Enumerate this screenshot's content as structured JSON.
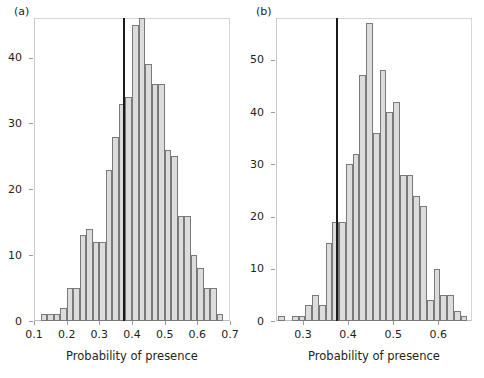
{
  "figure": {
    "width": 484,
    "height": 378,
    "background": "#ffffff",
    "bar_fill": "#dcdcdc",
    "bar_stroke": "#7a7a7a",
    "vline_color": "#1a1a1a",
    "frame_color": "#d6d6d6"
  },
  "chart_data": [
    {
      "type": "bar",
      "panel": "(a)",
      "title": "",
      "subtitle": "",
      "xlabel": "Probability of presence",
      "ylabel": "",
      "xlim": [
        0.1,
        0.7
      ],
      "ylim": [
        0,
        46
      ],
      "grid": false,
      "legend": "none",
      "xticks": [
        0.1,
        0.2,
        0.3,
        0.4,
        0.5,
        0.6,
        0.7
      ],
      "xtick_labels": [
        "0.1",
        "0.2",
        "0.3",
        "0.4",
        "0.5",
        "0.6",
        "0.7"
      ],
      "yticks": [
        0,
        10,
        20,
        30,
        40
      ],
      "ytick_labels": [
        "0",
        "10",
        "20",
        "30",
        "40"
      ],
      "bin_width": 0.02,
      "bin_starts": [
        0.12,
        0.14,
        0.16,
        0.18,
        0.2,
        0.22,
        0.24,
        0.26,
        0.28,
        0.3,
        0.32,
        0.34,
        0.36,
        0.38,
        0.4,
        0.42,
        0.44,
        0.46,
        0.48,
        0.5,
        0.52,
        0.54,
        0.56,
        0.58,
        0.6,
        0.62,
        0.64,
        0.66
      ],
      "values": [
        1,
        1,
        1,
        2,
        5,
        5,
        13,
        14,
        12,
        12,
        23,
        28,
        33,
        34,
        45,
        46,
        39,
        36,
        36,
        26,
        25,
        16,
        16,
        10,
        8,
        5,
        5,
        1
      ],
      "annotations": [
        {
          "kind": "vertical-line",
          "x": 0.375,
          "label": "observed value"
        }
      ]
    },
    {
      "type": "bar",
      "panel": "(b)",
      "title": "",
      "subtitle": "",
      "xlabel": "Probability of presence",
      "ylabel": "",
      "xlim": [
        0.24,
        0.675
      ],
      "ylim": [
        0,
        58
      ],
      "grid": false,
      "legend": "none",
      "xticks": [
        0.3,
        0.4,
        0.5,
        0.6
      ],
      "xtick_labels": [
        "0.3",
        "0.4",
        "0.5",
        "0.6"
      ],
      "yticks": [
        0,
        10,
        20,
        30,
        40,
        50
      ],
      "ytick_labels": [
        "0",
        "10",
        "20",
        "30",
        "40",
        "50"
      ],
      "bin_width": 0.015,
      "bin_starts": [
        0.245,
        0.26,
        0.275,
        0.29,
        0.305,
        0.32,
        0.335,
        0.35,
        0.365,
        0.38,
        0.395,
        0.41,
        0.425,
        0.44,
        0.455,
        0.47,
        0.485,
        0.5,
        0.515,
        0.53,
        0.545,
        0.56,
        0.575,
        0.59,
        0.605,
        0.62,
        0.635,
        0.65
      ],
      "values": [
        1,
        0,
        1,
        1,
        3,
        5,
        3,
        15,
        19,
        19,
        30,
        32,
        47,
        57,
        36,
        48,
        40,
        42,
        28,
        28,
        24,
        22,
        4,
        10,
        5,
        5,
        2,
        1
      ],
      "annotations": [
        {
          "kind": "vertical-line",
          "x": 0.3755,
          "label": "observed value"
        }
      ]
    }
  ]
}
